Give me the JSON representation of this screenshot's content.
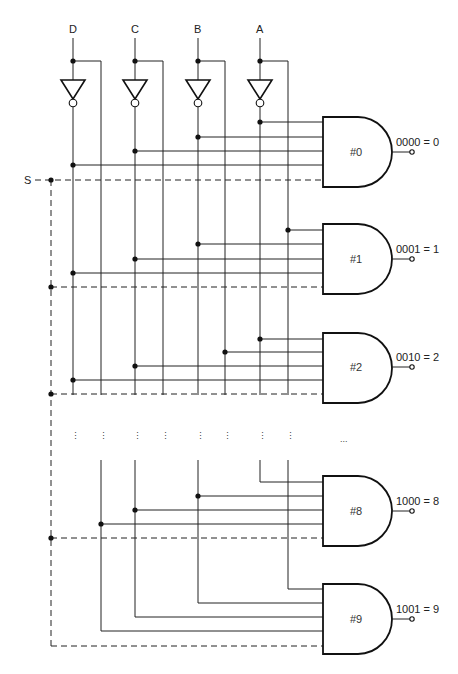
{
  "diagram": {
    "type": "BCD-to-decimal decoder (AND gate matrix)",
    "inputs": [
      {
        "name": "D",
        "x": 73,
        "true_x": 101
      },
      {
        "name": "C",
        "x": 135,
        "true_x": 163
      },
      {
        "name": "B",
        "x": 198,
        "true_x": 225
      },
      {
        "name": "A",
        "x": 260,
        "true_x": 288
      }
    ],
    "strobe": {
      "label": "S",
      "y": 180,
      "x": 51
    },
    "gates": [
      {
        "id": "#0",
        "label": "#0",
        "output": "0000 = 0",
        "top": 117
      },
      {
        "id": "#1",
        "label": "#1",
        "output": "0001 = 1",
        "top": 224
      },
      {
        "id": "#2",
        "label": "#2",
        "output": "0010 = 2",
        "top": 333
      },
      {
        "id": "#8",
        "label": "#8",
        "output": "1000 = 8",
        "top": 476
      },
      {
        "id": "#9",
        "label": "#9",
        "output": "1001 = 9",
        "top": 584
      }
    ],
    "continuation": {
      "dots": "⋮",
      "gate_ellipsis": "..."
    }
  }
}
